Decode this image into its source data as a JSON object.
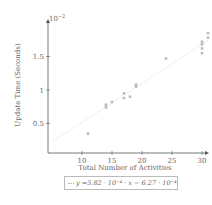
{
  "chart_data": {
    "type": "scatter",
    "title": "",
    "xlabel": "Total Number of Activities",
    "ylabel": "Update Time (Seconds)",
    "y_scale_note": "10^-2",
    "xlim": [
      5,
      31
    ],
    "ylim": [
      0.05,
      1.95
    ],
    "x_ticks": [
      10,
      15,
      20,
      25,
      30
    ],
    "y_ticks": [
      0.5,
      1,
      1.5
    ],
    "grid": false,
    "legend_position": "below",
    "series": [
      {
        "name": "measurements",
        "points": [
          [
            11,
            0.35
          ],
          [
            14,
            0.74
          ],
          [
            14,
            0.78
          ],
          [
            15,
            0.82
          ],
          [
            17,
            0.88
          ],
          [
            17,
            0.95
          ],
          [
            18,
            0.9
          ],
          [
            19,
            1.05
          ],
          [
            19,
            1.08
          ],
          [
            24,
            1.47
          ],
          [
            30,
            1.55
          ],
          [
            30,
            1.62
          ],
          [
            30,
            1.68
          ],
          [
            30,
            1.72
          ],
          [
            31,
            1.78
          ],
          [
            31,
            1.85
          ]
        ]
      },
      {
        "name": "y = 5.82 · 10^-4 · x − 6.27 · 10^-4",
        "type": "line",
        "slope": 0.0582,
        "intercept": -0.0627,
        "x_range": [
          5,
          31
        ]
      }
    ]
  },
  "labels": {
    "xlabel": "Total Number of Activities",
    "ylabel": "Update Time (Seconds)",
    "scale": "10",
    "scale_exp": "−2",
    "x_ticks": [
      "10",
      "15",
      "20",
      "25",
      "30"
    ],
    "y_ticks": [
      "0.5",
      "1",
      "1.5"
    ],
    "legend": "y =5.82 · 10⁻⁴ · x − 6.27 · 10⁻⁴"
  },
  "colors": {
    "axis": "#555555",
    "points": "#bbbbbb",
    "trend": "#cccccc"
  }
}
